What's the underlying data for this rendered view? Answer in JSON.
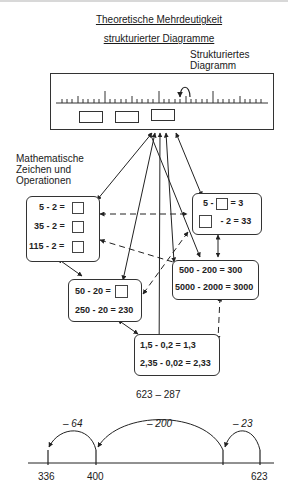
{
  "title": {
    "line1": "Theoretische Mehrdeutigkeit",
    "line2": "strukturierter Diagramme"
  },
  "structured_diagram_label": {
    "line1": "Strukturiertes",
    "line2": "Diagramm"
  },
  "math_label": {
    "line1": "Mathematische",
    "line2": "Zeichen und",
    "line3": "Operationen"
  },
  "boxes": {
    "left": {
      "rows": [
        {
          "expr": "5 - 2 =",
          "blank": true
        },
        {
          "expr": "35 - 2 =",
          "blank": true
        },
        {
          "expr": "115 - 2 =",
          "blank": true
        }
      ]
    },
    "right": {
      "row1_a": "5 -",
      "row1_b": "= 3",
      "row2_b": "- 2 = 33"
    },
    "middle_left": {
      "row1": "50 - 20 =",
      "row2": "250 - 20 = 230"
    },
    "middle_right": {
      "row1": "500 - 200 = 300",
      "row2": "5000 - 2000 = 3000"
    },
    "bottom": {
      "row1": "1,5 - 0,2 = 1,3",
      "row2": "2,35 - 0,02 = 2,33"
    }
  },
  "problem": "623 – 287",
  "number_line": {
    "ticks": [
      "336",
      "400",
      "623"
    ],
    "jumps": [
      "– 64",
      "– 200",
      "– 23"
    ]
  },
  "colors": {
    "line": "#333333",
    "text": "#1a1a1a",
    "background": "#ffffff"
  }
}
